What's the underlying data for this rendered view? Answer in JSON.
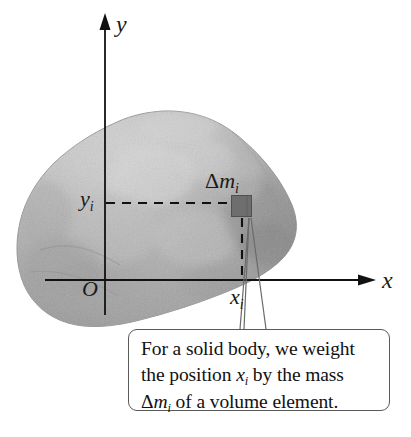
{
  "figure": {
    "kind": "physics-textbook-diagram",
    "background_color": "#ffffff"
  },
  "axes": {
    "y_axis_label": "y",
    "x_axis_label": "x",
    "origin_label": "O",
    "axis_color": "#111111"
  },
  "annotations": {
    "y_coordinate_label": "y",
    "y_coordinate_subscript": "i",
    "x_coordinate_label": "x",
    "x_coordinate_subscript": "i",
    "mass_element_delta": "Δ",
    "mass_element_label": "m",
    "mass_element_subscript": "i"
  },
  "body": {
    "name": "irregular solid body",
    "fill_light": "#cfcfcf",
    "fill_mid": "#b9b9b9",
    "fill_dark": "#8c8c8c",
    "outline": "#9a9a9a"
  },
  "mass_element": {
    "shape": "square",
    "fill": "#6e6e6e",
    "stroke": "#4a4a4a"
  },
  "callout": {
    "line1": "For a solid body, we weight",
    "line2_a": "the position ",
    "line2_x": "x",
    "line2_sub": "i",
    "line2_b": " by the mass",
    "line3_delta": "Δ",
    "line3_m": "m",
    "line3_sub": "i",
    "line3_b": " of a volume element.",
    "full_text": "For a solid body, we weight the position xi by the mass Δmi of a volume element.",
    "border_color": "#5a5a5a",
    "background_color": "#ffffff"
  }
}
